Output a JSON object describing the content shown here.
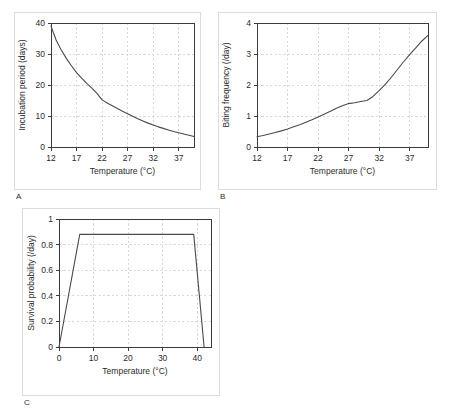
{
  "figure": {
    "panels": [
      {
        "letter": "A",
        "xlabel": "Temperature (°C)",
        "ylabel": "Incubation period (days)"
      },
      {
        "letter": "B",
        "xlabel": "Temperature (°C)",
        "ylabel": "Biting frequency (/day)"
      },
      {
        "letter": "C",
        "xlabel": "Temperature (°C)",
        "ylabel": "Survival probability (/day)"
      }
    ]
  },
  "chart_data": [
    {
      "type": "line",
      "panel": "A",
      "title": "",
      "xlabel": "Temperature (°C)",
      "ylabel": "Incubation period (days)",
      "xlim": [
        12,
        40
      ],
      "ylim": [
        0,
        40
      ],
      "xticks": [
        12,
        17,
        22,
        27,
        32,
        37
      ],
      "yticks": [
        0,
        10,
        20,
        30,
        40
      ],
      "grid": true,
      "legend": "none",
      "x": [
        12,
        13,
        14,
        15,
        16,
        17,
        18,
        19,
        20,
        21,
        22,
        23,
        24,
        25,
        26,
        27,
        28,
        29,
        30,
        31,
        32,
        33,
        34,
        35,
        36,
        37,
        38,
        39,
        40
      ],
      "values": [
        39.0,
        34.5,
        31.3,
        28.6,
        26.2,
        24.0,
        22.2,
        20.5,
        19.0,
        17.3,
        15.2,
        14.2,
        13.3,
        12.4,
        11.5,
        10.7,
        9.9,
        9.1,
        8.4,
        7.7,
        7.1,
        6.5,
        6.0,
        5.5,
        5.0,
        4.6,
        4.2,
        3.8,
        3.4
      ]
    },
    {
      "type": "line",
      "panel": "B",
      "title": "",
      "xlabel": "Temperature (°C)",
      "ylabel": "Biting frequency (/day)",
      "xlim": [
        12,
        40
      ],
      "ylim": [
        0,
        4
      ],
      "xticks": [
        12,
        17,
        22,
        27,
        32,
        37
      ],
      "yticks": [
        0,
        1,
        2,
        3,
        4
      ],
      "grid": true,
      "legend": "none",
      "x": [
        12,
        13,
        14,
        15,
        16,
        17,
        18,
        19,
        20,
        21,
        22,
        23,
        24,
        25,
        26,
        27,
        28,
        29,
        30,
        31,
        32,
        33,
        34,
        35,
        36,
        37,
        38,
        39,
        40
      ],
      "values": [
        0.33,
        0.37,
        0.42,
        0.47,
        0.52,
        0.58,
        0.65,
        0.72,
        0.8,
        0.88,
        0.97,
        1.06,
        1.15,
        1.25,
        1.33,
        1.4,
        1.43,
        1.47,
        1.5,
        1.63,
        1.82,
        2.02,
        2.25,
        2.5,
        2.75,
        2.98,
        3.2,
        3.42,
        3.6
      ]
    },
    {
      "type": "line",
      "panel": "C",
      "title": "",
      "xlabel": "Temperature (°C)",
      "ylabel": "Survival probability (/day)",
      "xlim": [
        0,
        44
      ],
      "ylim": [
        0,
        1
      ],
      "xticks": [
        0,
        10,
        20,
        30,
        40
      ],
      "yticks": [
        0,
        0.2,
        0.4,
        0.6,
        0.8,
        1
      ],
      "grid": true,
      "legend": "none",
      "x": [
        0,
        6,
        39,
        42
      ],
      "values": [
        0.0,
        0.88,
        0.88,
        0.0
      ]
    }
  ]
}
